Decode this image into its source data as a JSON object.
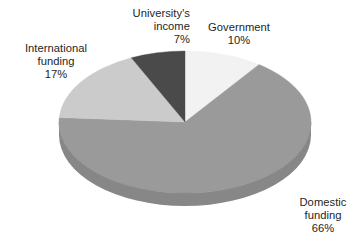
{
  "chart_data": {
    "type": "pie",
    "title": "",
    "subtitle": "",
    "xlabel": "",
    "ylabel": "",
    "legend_position": "none",
    "grid": false,
    "style": "3d-exploded-none",
    "units": "percent",
    "categories": [
      "Government",
      "Domestic funding",
      "International funding",
      "University's income"
    ],
    "values": [
      10,
      66,
      17,
      7
    ],
    "colors": [
      "#f2f2f2",
      "#9a9a9a",
      "#cbcbcb",
      "#4a4a4a"
    ],
    "slices": [
      {
        "name": "Government",
        "label_line1": "Government",
        "label_line2": "10%",
        "value": 10,
        "value_text": "10%",
        "color": "#f2f2f2",
        "side_color": "#d9d9d9",
        "start_angle_deg": 0,
        "end_angle_deg": 36
      },
      {
        "name": "Domestic funding",
        "label_line1": "Domestic",
        "label_line2": "funding",
        "label_line3": "66%",
        "value": 66,
        "value_text": "66%",
        "color": "#9a9a9a",
        "side_color": "#878787",
        "start_angle_deg": 36,
        "end_angle_deg": 273.6
      },
      {
        "name": "International funding",
        "label_line1": "International",
        "label_line2": "funding",
        "label_line3": "17%",
        "value": 17,
        "value_text": "17%",
        "color": "#cbcbcb",
        "side_color": "#b2b2b2",
        "start_angle_deg": 273.6,
        "end_angle_deg": 334.8
      },
      {
        "name": "University's income",
        "label_line1": "University's",
        "label_line2": "income",
        "label_line3": "7%",
        "value": 7,
        "value_text": "7%",
        "color": "#4a4a4a",
        "side_color": "#3d3d3d",
        "start_angle_deg": 334.8,
        "end_angle_deg": 360
      }
    ]
  },
  "background_color": "#ffffff",
  "labels": {
    "university": {
      "line1": "University's",
      "line2": "income",
      "line3": "7%"
    },
    "government": {
      "line1": "Government",
      "line2": "10%"
    },
    "international": {
      "line1": "International",
      "line2": "funding",
      "line3": "17%"
    },
    "domestic": {
      "line1": "Domestic",
      "line2": "funding",
      "line3": "66%"
    }
  }
}
